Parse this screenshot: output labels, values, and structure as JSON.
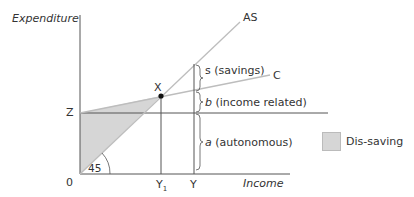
{
  "diagram": {
    "type": "keynesian-cross",
    "y_axis_label": "Expenditure",
    "x_axis_label": "Income",
    "origin_label": "0",
    "z_label": "Z",
    "angle_label": "45",
    "point_label": "X",
    "lines": {
      "as_label": "AS",
      "c_label": "C"
    },
    "x_ticks": {
      "y1_main": "Y",
      "y1_sub": "1",
      "y": "Y"
    },
    "braces": {
      "s_label": "s (savings)",
      "b_var": "b",
      "b_text": " (income related)",
      "a_var": "a",
      "a_text": " (autonomous)"
    },
    "legend": {
      "label": "Dis-saving",
      "color": "#d6d6d6"
    },
    "colors": {
      "axis": "#555555",
      "line": "#bdbdbd",
      "shade": "#d6d6d6",
      "point": "#111111"
    }
  }
}
